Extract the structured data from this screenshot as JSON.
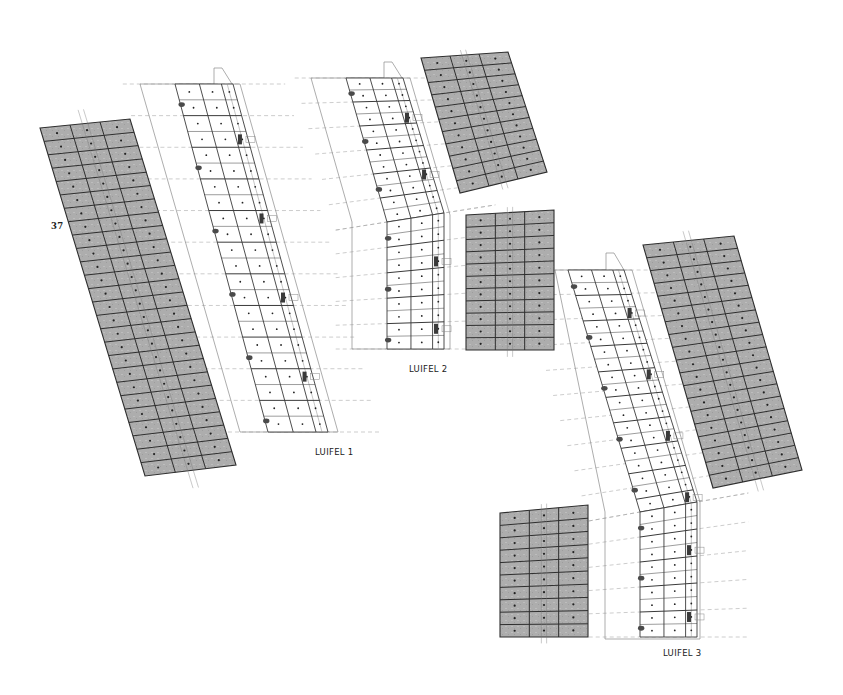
{
  "drawing": {
    "labels": {
      "luifel_1": "LUIFEL 1",
      "luifel_2": "LUIFEL 2",
      "luifel_3": "LUIFEL 3",
      "number_37": "37"
    },
    "colors": {
      "panel_fill": "#a9a9a9",
      "panel_fill_light": "#c2c2c2",
      "panel_line": "#2e2e2e",
      "frame_line": "#3a3a3a",
      "outline_line": "#8a8a8a",
      "dash_line": "#9a9a9a",
      "anchor": "#4a4a4a",
      "background": "#ffffff"
    },
    "groups": [
      {
        "id": "luifel-1",
        "roof_panels": {
          "corners": [
            [
              40,
              128
            ],
            [
              130,
              119
            ],
            [
              236,
              465
            ],
            [
              145,
              476
            ]
          ],
          "cols": 3,
          "rows": 26
        },
        "frame": {
          "corners": [
            [
              175,
              84
            ],
            [
              233,
              84
            ],
            [
              328,
              432
            ],
            [
              268,
              432
            ]
          ],
          "cols": 3,
          "rows": 22
        },
        "outline": [
          [
            140,
            84
          ],
          [
            214,
            84
          ],
          [
            214,
            68
          ],
          [
            222,
            68
          ],
          [
            232,
            84
          ],
          [
            240,
            84
          ],
          [
            338,
            432
          ],
          [
            240,
            432
          ]
        ]
      },
      {
        "id": "luifel-2",
        "roof_panels_top": {
          "corners": [
            [
              421,
              58
            ],
            [
              508,
              52
            ],
            [
              547,
              172
            ],
            [
              460,
              193
            ]
          ],
          "cols": 3,
          "rows": 11
        },
        "roof_panels_bottom": {
          "corners": [
            [
              466,
              215
            ],
            [
              554,
              210
            ],
            [
              554,
              350
            ],
            [
              466,
              350
            ]
          ],
          "cols": 3,
          "rows": 11
        },
        "frame_top": {
          "corners": [
            [
              346,
              78
            ],
            [
              403,
              78
            ],
            [
              444,
              213
            ],
            [
              387,
              222
            ]
          ],
          "cols": 3,
          "rows": 12
        },
        "frame_bottom": {
          "corners": [
            [
              387,
              222
            ],
            [
              444,
              213
            ],
            [
              444,
              349
            ],
            [
              387,
              349
            ]
          ],
          "cols": 3,
          "rows": 10
        },
        "outline": [
          [
            311,
            78
          ],
          [
            384,
            78
          ],
          [
            384,
            62
          ],
          [
            392,
            62
          ],
          [
            402,
            78
          ],
          [
            410,
            78
          ],
          [
            450,
            215
          ],
          [
            450,
            349
          ],
          [
            352,
            349
          ],
          [
            352,
            222
          ]
        ]
      },
      {
        "id": "luifel-3",
        "roof_panels_top": {
          "corners": [
            [
              643,
              245
            ],
            [
              734,
              236
            ],
            [
              802,
              470
            ],
            [
              713,
              488
            ]
          ],
          "cols": 3,
          "rows": 19
        },
        "roof_panels_bottom": {
          "corners": [
            [
              500,
              513
            ],
            [
              588,
              505
            ],
            [
              588,
              637
            ],
            [
              500,
              637
            ]
          ],
          "cols": 3,
          "rows": 10
        },
        "frame_top": {
          "corners": [
            [
              568,
              270
            ],
            [
              624,
              270
            ],
            [
              697,
              502
            ],
            [
              640,
              512
            ]
          ],
          "cols": 3,
          "rows": 19
        },
        "frame_bottom": {
          "corners": [
            [
              640,
              512
            ],
            [
              697,
              502
            ],
            [
              697,
              637
            ],
            [
              640,
              637
            ]
          ],
          "cols": 3,
          "rows": 10
        },
        "outline": [
          [
            555,
            270
          ],
          [
            606,
            270
          ],
          [
            606,
            253
          ],
          [
            614,
            253
          ],
          [
            624,
            270
          ],
          [
            632,
            270
          ],
          [
            700,
            502
          ],
          [
            700,
            639
          ],
          [
            605,
            639
          ],
          [
            605,
            512
          ]
        ]
      }
    ]
  }
}
